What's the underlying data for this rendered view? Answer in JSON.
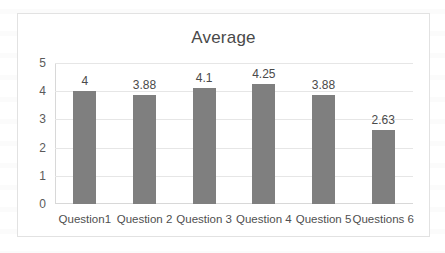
{
  "chart_data": {
    "type": "bar",
    "title": "Average",
    "xlabel": "",
    "ylabel": "",
    "ylim": [
      0,
      5
    ],
    "yticks": [
      "5",
      "4",
      "3",
      "2",
      "1",
      "0"
    ],
    "grid": true,
    "legend": "none",
    "bar_color": "#7f7f7f",
    "categories": [
      "Question1",
      "Question 2",
      "Question 3",
      "Question 4",
      "Question 5",
      "Questions 6"
    ],
    "values": [
      4,
      3.88,
      4.1,
      4.25,
      3.88,
      2.63
    ],
    "data_labels": [
      "4",
      "3.88",
      "4.1",
      "4.25",
      "3.88",
      "2.63"
    ]
  }
}
